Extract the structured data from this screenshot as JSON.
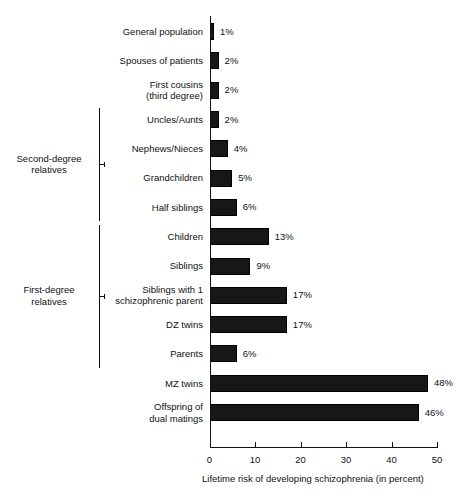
{
  "chart_data": {
    "type": "bar",
    "orientation": "horizontal",
    "title": "",
    "xlabel": "Lifetime risk of developing schizophrenia (in percent)",
    "ylabel": "",
    "xlim": [
      0,
      50
    ],
    "xticks": [
      0,
      10,
      20,
      30,
      40,
      50
    ],
    "xtick_labels": [
      "0",
      "10",
      "20",
      "30",
      "40",
      "50"
    ],
    "grid": false,
    "legend": null,
    "value_suffix": "%",
    "bar_color": "#171717",
    "background_color": "#ffffff",
    "categories": [
      "General population",
      "Spouses of patients",
      "First cousins\n(third degree)",
      "Uncles/Aunts",
      "Nephews/Nieces",
      "Grandchildren",
      "Half siblings",
      "Children",
      "Siblings",
      "Siblings with 1\nschizophrenic parent",
      "DZ twins",
      "Parents",
      "MZ twins",
      "Offspring of\ndual matings"
    ],
    "values": [
      1,
      2,
      2,
      2,
      4,
      5,
      6,
      13,
      9,
      17,
      17,
      6,
      48,
      46
    ],
    "value_labels": [
      "1%",
      "2%",
      "2%",
      "2%",
      "4%",
      "5%",
      "6%",
      "13%",
      "9%",
      "17%",
      "17%",
      "6%",
      "48%",
      "46%"
    ],
    "groups": [
      {
        "label": "Second-degree\nrelatives",
        "members": [
          "Uncles/Aunts",
          "Nephews/Nieces",
          "Grandchildren",
          "Half siblings"
        ]
      },
      {
        "label": "First-degree\nrelatives",
        "members": [
          "Children",
          "Siblings",
          "Siblings with 1 schizophrenic parent",
          "DZ twins",
          "Parents"
        ]
      }
    ]
  },
  "rows": [
    {
      "label_line1": "General population",
      "label_line2": "",
      "value": 1,
      "value_label": "1%"
    },
    {
      "label_line1": "Spouses of patients",
      "label_line2": "",
      "value": 2,
      "value_label": "2%"
    },
    {
      "label_line1": "First cousins",
      "label_line2": "(third degree)",
      "value": 2,
      "value_label": "2%"
    },
    {
      "label_line1": "Uncles/Aunts",
      "label_line2": "",
      "value": 2,
      "value_label": "2%"
    },
    {
      "label_line1": "Nephews/Nieces",
      "label_line2": "",
      "value": 4,
      "value_label": "4%"
    },
    {
      "label_line1": "Grandchildren",
      "label_line2": "",
      "value": 5,
      "value_label": "5%"
    },
    {
      "label_line1": "Half siblings",
      "label_line2": "",
      "value": 6,
      "value_label": "6%"
    },
    {
      "label_line1": "Children",
      "label_line2": "",
      "value": 13,
      "value_label": "13%"
    },
    {
      "label_line1": "Siblings",
      "label_line2": "",
      "value": 9,
      "value_label": "9%"
    },
    {
      "label_line1": "Siblings with 1",
      "label_line2": "schizophrenic parent",
      "value": 17,
      "value_label": "17%"
    },
    {
      "label_line1": "DZ twins",
      "label_line2": "",
      "value": 17,
      "value_label": "17%"
    },
    {
      "label_line1": "Parents",
      "label_line2": "",
      "value": 6,
      "value_label": "6%"
    },
    {
      "label_line1": "MZ twins",
      "label_line2": "",
      "value": 48,
      "value_label": "48%"
    },
    {
      "label_line1": "Offspring of",
      "label_line2": "dual matings",
      "value": 46,
      "value_label": "46%"
    }
  ],
  "groups": [
    {
      "name": "second-degree",
      "label_line1": "Second-degree",
      "label_line2": "relatives",
      "start_row": 3,
      "end_row": 6
    },
    {
      "name": "first-degree",
      "label_line1": "First-degree",
      "label_line2": "relatives",
      "start_row": 7,
      "end_row": 11
    }
  ],
  "axis": {
    "title": "Lifetime risk of developing schizophrenia (in percent)",
    "ticks": [
      "0",
      "10",
      "20",
      "30",
      "40",
      "50"
    ]
  }
}
